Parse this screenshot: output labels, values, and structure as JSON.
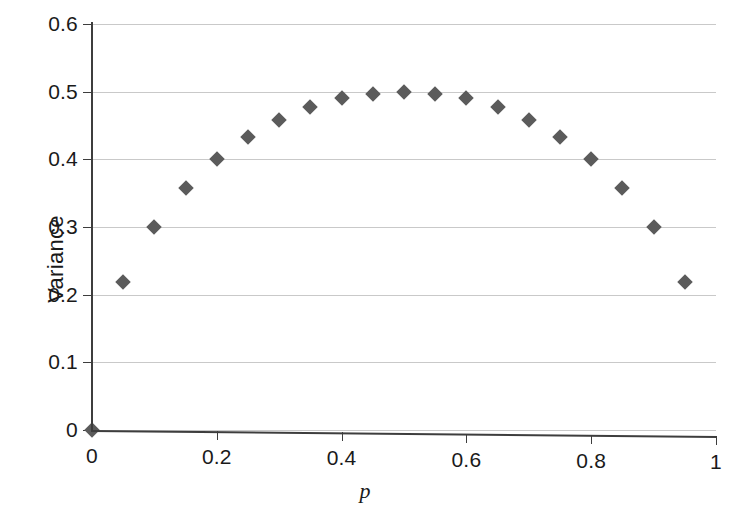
{
  "chart_data": {
    "type": "scatter",
    "title": "",
    "xlabel": "p",
    "ylabel": "Variance",
    "xlim": [
      0,
      1
    ],
    "ylim": [
      0,
      0.6
    ],
    "grid": true,
    "legend": "none",
    "marker": "diamond",
    "marker_color": "#5b5b5b",
    "x_ticks": [
      0,
      0.2,
      0.4,
      0.6,
      0.8,
      1
    ],
    "x_tick_labels": [
      "0",
      "0.2",
      "0.4",
      "0.6",
      "0.8",
      "1"
    ],
    "y_ticks": [
      0,
      0.1,
      0.2,
      0.3,
      0.4,
      0.5,
      0.6
    ],
    "y_tick_labels": [
      "0",
      "0.1",
      "0.2",
      "0.3",
      "0.4",
      "0.5",
      "0.6"
    ],
    "x": [
      0,
      0.05,
      0.1,
      0.15,
      0.2,
      0.25,
      0.3,
      0.35,
      0.4,
      0.45,
      0.5,
      0.55,
      0.6,
      0.65,
      0.7,
      0.75,
      0.8,
      0.85,
      0.9,
      0.95
    ],
    "values": [
      0,
      0.218,
      0.3,
      0.357,
      0.4,
      0.433,
      0.458,
      0.477,
      0.49,
      0.497,
      0.5,
      0.497,
      0.49,
      0.477,
      0.458,
      0.433,
      0.4,
      0.357,
      0.3,
      0.218
    ],
    "series": [
      {
        "name": "Variance",
        "values": [
          0,
          0.218,
          0.3,
          0.357,
          0.4,
          0.433,
          0.458,
          0.477,
          0.49,
          0.497,
          0.5,
          0.497,
          0.49,
          0.477,
          0.458,
          0.433,
          0.4,
          0.357,
          0.3,
          0.218
        ]
      }
    ]
  },
  "caption": ""
}
